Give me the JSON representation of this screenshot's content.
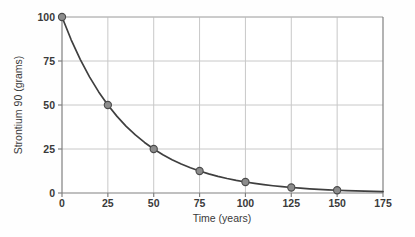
{
  "chart_data": {
    "type": "line",
    "title": "",
    "xlabel": "Time (years)",
    "ylabel": "Strontium 90 (grams)",
    "xlim": [
      0,
      175
    ],
    "ylim": [
      0,
      100
    ],
    "xticks": [
      0,
      25,
      50,
      75,
      100,
      125,
      150,
      175
    ],
    "xtick_labels": [
      "0",
      "25",
      "50",
      "75",
      "100",
      "125",
      "150",
      "175"
    ],
    "yticks": [
      0,
      25,
      50,
      75,
      100
    ],
    "ytick_labels": [
      "0",
      "25",
      "50",
      "75",
      "100"
    ],
    "grid": true,
    "legend": false,
    "legend_position": "none",
    "x": [
      0,
      25,
      50,
      75,
      100,
      125,
      150
    ],
    "values": [
      100,
      50,
      25,
      12.5,
      6.25,
      3.125,
      1.5625
    ],
    "marker": "circle",
    "series": [
      {
        "name": "Strontium 90 remaining",
        "x": [
          0,
          25,
          50,
          75,
          100,
          125,
          150
        ],
        "values": [
          100,
          50,
          25,
          12.5,
          6.25,
          3.125,
          1.5625
        ]
      }
    ],
    "curve_x": [
      0,
      5,
      10,
      15,
      20,
      25,
      30,
      35,
      40,
      45,
      50,
      55,
      60,
      65,
      70,
      75,
      80,
      85,
      90,
      95,
      100,
      105,
      110,
      115,
      120,
      125,
      130,
      135,
      140,
      145,
      150,
      155,
      160,
      165,
      170,
      175
    ],
    "curve_values": [
      100,
      87.06,
      75.79,
      65.98,
      57.43,
      50,
      43.53,
      37.89,
      32.99,
      28.72,
      25,
      21.76,
      18.95,
      16.49,
      14.36,
      12.5,
      10.88,
      9.47,
      8.25,
      7.18,
      6.25,
      5.44,
      4.74,
      4.12,
      3.59,
      3.125,
      2.72,
      2.37,
      2.06,
      1.79,
      1.5625,
      1.36,
      1.18,
      1.03,
      0.9,
      0.78
    ],
    "half_life_years": 25,
    "annotations": []
  },
  "style": {
    "background": "#fefefe",
    "plot_background": "#ffffff",
    "axis_color": "#808080",
    "grid_color": "#c8c8c8",
    "curve_color": "#3f3f3f",
    "marker_fill": "#8c8c8c",
    "marker_edge": "#4a4a4a",
    "text_color": "#3a3a3a"
  },
  "geometry": {
    "plot_left": 62,
    "plot_right": 383,
    "plot_top": 17,
    "plot_bottom": 193
  }
}
